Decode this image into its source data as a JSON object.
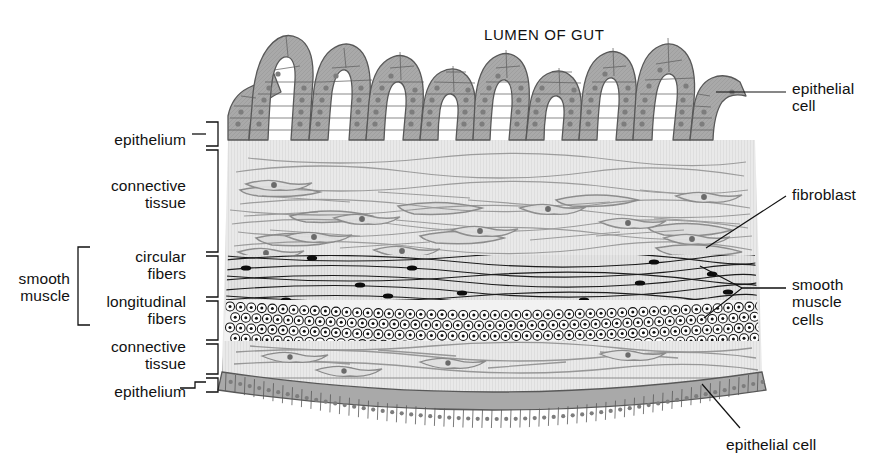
{
  "figure": {
    "title": "LUMEN OF GUT"
  },
  "left_labels": [
    {
      "id": "epithelium-top",
      "text": "epithelium",
      "x": 186,
      "y": 131,
      "align": "right"
    },
    {
      "id": "connective-tissue-top",
      "text": "connective\ntissue",
      "x": 186,
      "y": 177,
      "align": "right"
    },
    {
      "id": "circular-fibers",
      "text": "circular\nfibers",
      "x": 186,
      "y": 248,
      "align": "right"
    },
    {
      "id": "longitudinal-fibers",
      "text": "longitudinal\nfibers",
      "x": 186,
      "y": 293,
      "align": "right"
    },
    {
      "id": "connective-tissue-bot",
      "text": "connective\ntissue",
      "x": 186,
      "y": 338,
      "align": "right"
    },
    {
      "id": "smooth-muscle-group",
      "text": "smooth\nmuscle",
      "x": 70,
      "y": 270,
      "align": "right"
    },
    {
      "id": "epithelium-bottom",
      "text": "epithelium",
      "x": 186,
      "y": 383,
      "align": "right"
    }
  ],
  "right_labels": [
    {
      "id": "epithelial-cell-top",
      "text": "epithelial\ncell",
      "x": 792,
      "y": 80,
      "align": "left"
    },
    {
      "id": "fibroblast",
      "text": "fibroblast",
      "x": 792,
      "y": 186,
      "align": "left"
    },
    {
      "id": "smooth-muscle-cells",
      "text": "smooth\nmuscle\ncells",
      "x": 792,
      "y": 276,
      "align": "left"
    },
    {
      "id": "epithelial-cell-bottom",
      "text": "epithelial cell",
      "x": 726,
      "y": 436,
      "align": "left"
    }
  ],
  "layers": [
    {
      "name": "epithelium",
      "order": 1,
      "kind": "villi-columnar-epithelium"
    },
    {
      "name": "connective tissue",
      "order": 2,
      "kind": "fibroblasts-and-collagen"
    },
    {
      "name": "circular fibers",
      "order": 3,
      "kind": "smooth-muscle-longitudinal-view"
    },
    {
      "name": "longitudinal fibers",
      "order": 4,
      "kind": "smooth-muscle-cross-section"
    },
    {
      "name": "connective tissue",
      "order": 5,
      "kind": "fibroblasts-and-collagen"
    },
    {
      "name": "epithelium",
      "order": 6,
      "kind": "flat-mesothelium"
    }
  ],
  "counts": {
    "villi": 8,
    "villus_tip_positions": [
      265,
      320,
      372,
      424,
      476,
      528,
      580,
      640
    ]
  },
  "colors": {
    "epithelium_fill": "#a9a9a9",
    "epithelium_stroke": "#5a5a5a",
    "nucleus": "#7d7d7d",
    "tissue_fill": "#e6e6e6",
    "tissue_stroke": "#8c8c8c",
    "muscle_nucleus": "#111111",
    "line": "#1a1a1a",
    "text": "#111111",
    "background": "#ffffff"
  }
}
